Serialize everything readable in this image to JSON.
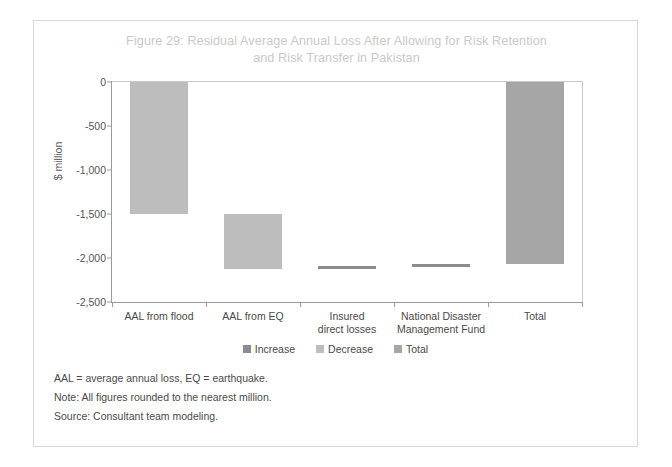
{
  "figure": {
    "title": "Figure 29: Residual Average Annual Loss After Allowing for Risk Retention and Risk Transfer in Pakistan",
    "title_line1": "Figure 29: Residual Average Annual Loss After Allowing for Risk Retention",
    "title_line2": "and Risk Transfer in Pakistan"
  },
  "colors": {
    "increase": "#8c8c8c",
    "decrease": "#bdbdbd",
    "total": "#a6a6a6",
    "axis": "#9a9a9a",
    "title": "#c9c9c9",
    "frame": "#d8d8d8",
    "text": "#4a4a4a"
  },
  "legend": {
    "position": "bottom-center",
    "items": [
      {
        "label": "Increase",
        "color": "#8c8c8c"
      },
      {
        "label": "Decrease",
        "color": "#bdbdbd"
      },
      {
        "label": "Total",
        "color": "#a6a6a6"
      }
    ]
  },
  "notes": [
    "AAL = average annual loss, EQ = earthquake.",
    "Note: All figures rounded to the nearest million.",
    "Source: Consultant team modeling."
  ],
  "chart_data": {
    "type": "bar",
    "subtype": "waterfall",
    "title": "Figure 29: Residual Average Annual Loss After Allowing for Risk Retention and Risk Transfer in Pakistan",
    "xlabel": "",
    "ylabel": "$ million",
    "ylim": [
      -2500,
      0
    ],
    "yticks": [
      0,
      -500,
      -1000,
      -1500,
      -2000,
      -2500
    ],
    "ytick_labels": [
      "0",
      "-500",
      "-1,000",
      "-1,500",
      "-2,000",
      "-2,500"
    ],
    "grid": false,
    "categories": [
      "AAL from flood",
      "AAL from EQ",
      "Insured\ndirect losses",
      "National Disaster\nManagement Fund",
      "Total"
    ],
    "bars": [
      {
        "category": "AAL from flood",
        "kind": "Decrease",
        "start": 0,
        "end": -1500,
        "value": -1500,
        "color": "#bdbdbd"
      },
      {
        "category": "AAL from EQ",
        "kind": "Decrease",
        "start": -1500,
        "end": -2120,
        "value": -620,
        "color": "#bdbdbd"
      },
      {
        "category": "Insured direct losses",
        "kind": "Increase",
        "start": -2120,
        "end": -2095,
        "value": 25,
        "color": "#8c8c8c"
      },
      {
        "category": "National Disaster Management Fund",
        "kind": "Increase",
        "start": -2095,
        "end": -2070,
        "value": 25,
        "color": "#8c8c8c"
      },
      {
        "category": "Total",
        "kind": "Total",
        "start": 0,
        "end": -2070,
        "value": -2070,
        "color": "#a6a6a6"
      }
    ]
  }
}
